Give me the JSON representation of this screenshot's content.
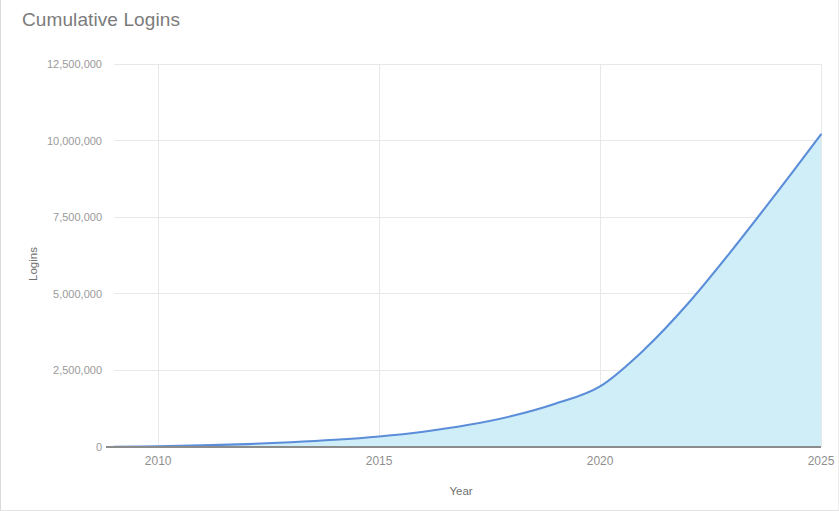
{
  "card": {
    "title": "Cumulative Logins",
    "background_color": "#ffffff",
    "border_color": "#d9d9d9"
  },
  "chart_data": {
    "type": "area",
    "title": "Cumulative Logins",
    "xlabel": "Year",
    "ylabel": "Logins",
    "xlim": [
      2009,
      2025
    ],
    "ylim": [
      0,
      12500000
    ],
    "grid": true,
    "legend": false,
    "legend_position": "none",
    "line_color": "#5b8dd9",
    "fill_color": "#cfeef8",
    "x_ticks": [
      2010,
      2015,
      2020,
      2025
    ],
    "x_tick_labels": [
      "2010",
      "2015",
      "2020",
      "2025"
    ],
    "y_ticks": [
      0,
      2500000,
      5000000,
      7500000,
      10000000,
      12500000
    ],
    "y_tick_labels": [
      "0",
      "2,500,000",
      "5,000,000",
      "7,500,000",
      "10,000,000",
      "12,500,000"
    ],
    "series": [
      {
        "name": "Cumulative Logins",
        "x": [
          2009,
          2010,
          2011,
          2012,
          2013,
          2014,
          2015,
          2016,
          2017,
          2018,
          2019,
          2020,
          2021,
          2022,
          2023,
          2024,
          2025
        ],
        "values": [
          5000,
          22000,
          52000,
          95000,
          155000,
          235000,
          345000,
          500000,
          715000,
          1010000,
          1420000,
          1980000,
          3180000,
          4700000,
          6450000,
          8300000,
          10200000
        ]
      }
    ]
  }
}
